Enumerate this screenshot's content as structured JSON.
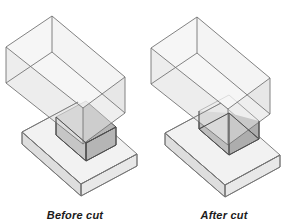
{
  "figure": {
    "kind": "isometric-technical-diagram",
    "background_color": "#ffffff",
    "panels": [
      {
        "id": "before",
        "caption": "Before cut",
        "description": "Transparent rectangular box passing through an intact flat slab; the overlapping volume is shaded darker.",
        "solids": [
          {
            "name": "upper-box",
            "role": "cutting-tool-box"
          },
          {
            "name": "lower-slab",
            "role": "target-slab-intact"
          },
          {
            "name": "intersection-volume",
            "role": "overlap-shaded"
          }
        ]
      },
      {
        "id": "after",
        "caption": "After cut",
        "description": "Same transparent box, but the slab now has a notch removed where the box intersected it.",
        "solids": [
          {
            "name": "upper-box",
            "role": "cutting-tool-box"
          },
          {
            "name": "lower-slab",
            "role": "target-slab-notched"
          },
          {
            "name": "notch-void",
            "role": "removed-material"
          }
        ]
      }
    ],
    "style": {
      "edge_color": "#6e6e6e",
      "edge_color_dark": "#4a4a4a",
      "face_fill_light": "#f0f0f0",
      "face_fill_mid": "#e4e4e4",
      "face_fill_dark": "#cfcfcf",
      "overlap_fill": "#b9b9b9",
      "caption_color": "#1b1b1b"
    }
  }
}
